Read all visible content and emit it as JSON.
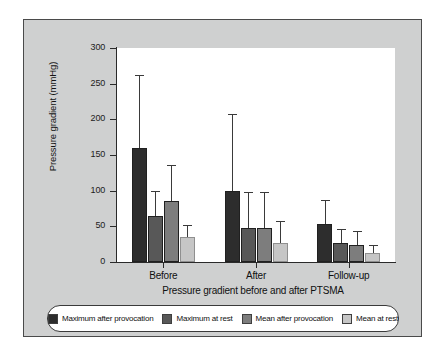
{
  "chart_data": {
    "type": "bar",
    "title": "",
    "xlabel": "Pressure gradient before and after PTSMA",
    "ylabel": "Pressure gradient (mmHg)",
    "ylim": [
      0,
      300
    ],
    "yticks": [
      0,
      50,
      100,
      150,
      200,
      250,
      300
    ],
    "grid": false,
    "legend_position": "bottom",
    "categories": [
      "Before",
      "After",
      "Follow-up"
    ],
    "series": [
      {
        "name": "Maximum after provocation",
        "color": "#2d2d2d",
        "values": [
          160,
          100,
          53
        ],
        "error_high": [
          262,
          208,
          87
        ]
      },
      {
        "name": "Maximum at rest",
        "color": "#585858",
        "values": [
          65,
          48,
          27
        ],
        "error_high": [
          100,
          98,
          46
        ]
      },
      {
        "name": "Mean after provocation",
        "color": "#7d7d7d",
        "values": [
          85,
          48,
          24
        ],
        "error_high": [
          136,
          98,
          44
        ]
      },
      {
        "name": "Mean at rest",
        "color": "#c6c6c6",
        "values": [
          35,
          26,
          13
        ],
        "error_high": [
          52,
          57,
          24
        ]
      }
    ]
  },
  "axis": {
    "y_label": "Pressure gradient (mmHg)",
    "x_title": "Pressure gradient before and after PTSMA",
    "tick_300": "300",
    "tick_250": "250",
    "tick_200": "200",
    "tick_150": "150",
    "tick_100": "100",
    "tick_50": "50",
    "tick_0": "0",
    "group_before": "Before",
    "group_after": "After",
    "group_followup": "Follow-up"
  },
  "legend": {
    "items": [
      {
        "label": "Maximum after provocation",
        "color": "#2d2d2d"
      },
      {
        "label": "Maximum at rest",
        "color": "#585858"
      },
      {
        "label": "Mean after provocation",
        "color": "#7d7d7d"
      },
      {
        "label": "Mean at rest",
        "color": "#c6c6c6"
      }
    ]
  },
  "colors": {
    "panel_background": "#cfd0d0",
    "plot_background": "#ffffff",
    "axis": "#2a2a2a",
    "page_background": "#ffffff"
  }
}
